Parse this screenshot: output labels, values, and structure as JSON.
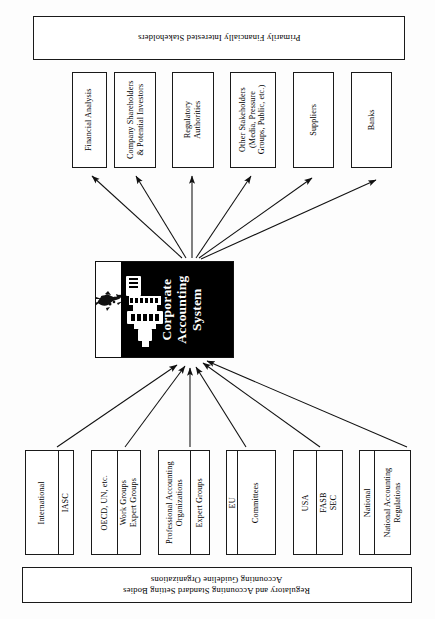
{
  "diagram": {
    "orientation": "rotated-90",
    "center": {
      "label": "Corporate\nAccounting\nSystem",
      "background_color": "#000000",
      "text_color": "#ffffff",
      "icons": [
        "printer-icon",
        "scribble-icon"
      ]
    },
    "top_banner": {
      "label": "Primarily Financially Interested Stakeholders"
    },
    "bottom_banner": {
      "label": "Regulatory and Accounting Standard Setting Bodies\nAccounting Guideline Organizations"
    },
    "stakeholders": [
      {
        "label": "Financial Analysis"
      },
      {
        "label": "Company Shareholders\n& Potential Investors"
      },
      {
        "label": "Regulatory\nAuthorities"
      },
      {
        "label": "Other Stakeholders\n(Media, Pressure\nGroups, Public, etc.)"
      },
      {
        "label": "Suppliers"
      },
      {
        "label": "Banks"
      }
    ],
    "regulators": [
      {
        "left": "International",
        "right": "IASC"
      },
      {
        "left": "OECD, UN, etc.",
        "right": "Work Groups\nExpert Groups"
      },
      {
        "left": "Professional Accounting\nOrganizations",
        "right": "Expert Groups"
      },
      {
        "left": "EU",
        "right": "Committees"
      },
      {
        "left": "USA",
        "right": "FASB\nSEC"
      },
      {
        "left": "National",
        "right": "National Accounting\nRegulations"
      }
    ]
  }
}
